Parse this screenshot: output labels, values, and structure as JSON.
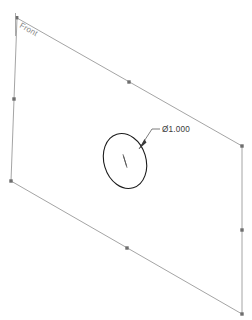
{
  "canvas": {
    "width": 252,
    "height": 320,
    "background": "#ffffff"
  },
  "drawing": {
    "type": "cad-sketch",
    "plane_label": "Front",
    "colors": {
      "sketch_line": "#9a9a9a",
      "circle_line": "#1c1c1c",
      "vertex_marker": "#6e6e6e",
      "dimension": "#3a3a3a",
      "plane_label": "#8a8a8a",
      "background": "#ffffff"
    },
    "plane": {
      "name": "front-plane-outline",
      "shape": "parallelogram",
      "vertices": [
        {
          "name": "top-left",
          "x": 17,
          "y": 18
        },
        {
          "name": "top-right",
          "x": 242,
          "y": 146
        },
        {
          "name": "bottom-right",
          "x": 242,
          "y": 314
        },
        {
          "name": "bottom-left",
          "x": 11,
          "y": 181
        }
      ],
      "edge_midpoints": [
        {
          "name": "top-edge-midpoint",
          "x": 129,
          "y": 82
        },
        {
          "name": "right-edge-midpoint",
          "x": 242,
          "y": 230
        },
        {
          "name": "bottom-edge-midpoint",
          "x": 127,
          "y": 248
        },
        {
          "name": "left-edge-midpoint",
          "x": 14,
          "y": 99
        }
      ]
    },
    "circle": {
      "name": "sketched-circle",
      "center": {
        "x": 125,
        "y": 161
      },
      "radius_x": 21,
      "radius_y": 28,
      "rotation_deg": -17,
      "center_mark": true
    },
    "dimension": {
      "name": "diameter-dimension",
      "value": "Ø1.000",
      "symbol": "Ø",
      "number": "1.000",
      "text_x": 162,
      "text_y": 131,
      "leader": {
        "arrow_point": {
          "x": 139,
          "y": 149
        },
        "elbow": {
          "x": 152,
          "y": 129
        },
        "shoulder_end": {
          "x": 160,
          "y": 129
        }
      }
    }
  }
}
